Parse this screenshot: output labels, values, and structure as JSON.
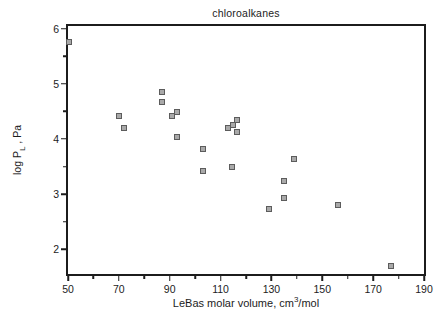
{
  "chart_data": {
    "type": "scatter",
    "title": "chloroalkanes",
    "xlabel": "LeBas molar volume, cm3/mol",
    "ylabel": "log P L , Pa",
    "xlabel_parts": {
      "prefix": "LeBas molar volume, cm",
      "superscript": "3",
      "suffix": "/mol"
    },
    "ylabel_parts": {
      "prefix": "log P",
      "subscript": "L",
      "suffix": " , Pa"
    },
    "xlim": [
      50,
      190
    ],
    "ylim": [
      1.55,
      6.05
    ],
    "xticks_major": [
      50,
      70,
      90,
      110,
      130,
      150,
      170,
      190
    ],
    "xticks_minor": [
      60,
      80,
      100,
      120,
      140,
      160,
      180
    ],
    "yticks_major": [
      2,
      3,
      4,
      5,
      6
    ],
    "yticks_minor": [
      2.5,
      3.5,
      4.5,
      5.5
    ],
    "grid": false,
    "legend": null,
    "marker_style": {
      "shape": "square",
      "fill": "#a9a9a9",
      "border": "#5c5c5c",
      "size_px": 6
    },
    "axis_color": "#1c1c1c",
    "background_color": "#ffffff",
    "points": [
      [
        50.5,
        5.76
      ],
      [
        70,
        4.42
      ],
      [
        72,
        4.2
      ],
      [
        87,
        4.85
      ],
      [
        87,
        4.67
      ],
      [
        91,
        4.41
      ],
      [
        93,
        4.49
      ],
      [
        93,
        4.03
      ],
      [
        103,
        3.82
      ],
      [
        103,
        3.41
      ],
      [
        113,
        4.2
      ],
      [
        115,
        4.26
      ],
      [
        116.5,
        4.35
      ],
      [
        116.5,
        4.12
      ],
      [
        114.5,
        3.5
      ],
      [
        129,
        2.73
      ],
      [
        135,
        3.24
      ],
      [
        135,
        2.92
      ],
      [
        139,
        3.63
      ],
      [
        156,
        2.8
      ],
      [
        177,
        1.7
      ]
    ]
  }
}
